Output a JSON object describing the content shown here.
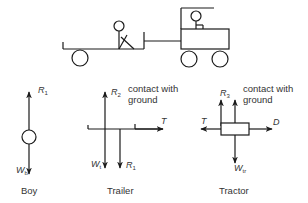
{
  "scene": {
    "description": "Boy sitting on trailer towed by tractor with driver",
    "objects": [
      "trailer",
      "boy",
      "tow-bar",
      "tractor",
      "driver"
    ]
  },
  "diagrams": {
    "boy": {
      "caption": "Boy",
      "forces": {
        "up": {
          "symbol": "R",
          "sub": "1"
        },
        "down": {
          "symbol": "W",
          "sub": "b"
        }
      }
    },
    "trailer": {
      "caption": "Trailer",
      "note": "contact with\nground",
      "forces": {
        "up": {
          "symbol": "R",
          "sub": "2"
        },
        "down1": {
          "symbol": "W",
          "sub": "t"
        },
        "down2": {
          "symbol": "R",
          "sub": "1"
        },
        "right": {
          "symbol": "T",
          "sub": ""
        }
      }
    },
    "tractor": {
      "caption": "Tractor",
      "note": "contact with\nground",
      "forces": {
        "up": {
          "symbol": "R",
          "sub": "3"
        },
        "down": {
          "symbol": "W",
          "sub": "tr"
        },
        "left": {
          "symbol": "T",
          "sub": ""
        },
        "right": {
          "symbol": "D",
          "sub": ""
        }
      }
    }
  },
  "colors": {
    "line": "#1a1a1a",
    "text": "#333333",
    "background": "#ffffff"
  }
}
